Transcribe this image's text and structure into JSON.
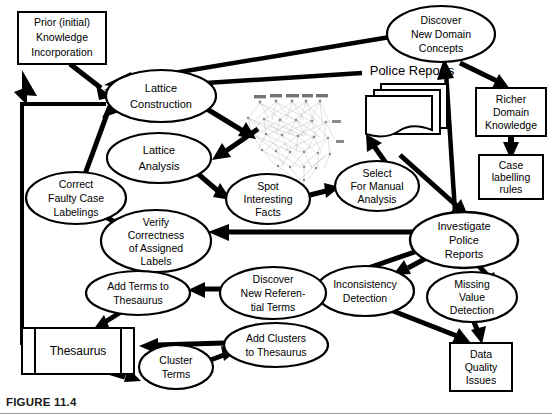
{
  "figure": {
    "caption": "FIGURE 11.4",
    "width": 552,
    "height": 415,
    "background_color": "#ffffff",
    "line_color": "#000000",
    "text_color": "#000000"
  },
  "diagram": {
    "type": "flow-diagram",
    "nodes": [
      {
        "id": "prior-knowledge",
        "shape": "rectangle",
        "label": "Prior (initial)\nKnowledge\nIncorporation",
        "lines": [
          "Prior (initial)",
          "Knowledge",
          "Incorporation"
        ],
        "cx": 62,
        "cy": 38,
        "w": 88,
        "h": 52
      },
      {
        "id": "lattice-construction",
        "shape": "ellipse",
        "label": "Lattice\nConstruction",
        "lines": [
          "Lattice",
          "Construction"
        ],
        "cx": 161,
        "cy": 96,
        "rx": 55,
        "ry": 26
      },
      {
        "id": "lattice-analysis",
        "shape": "ellipse",
        "label": "Lattice\nAnalysis",
        "lines": [
          "Lattice",
          "Analysis"
        ],
        "cx": 159,
        "cy": 158,
        "rx": 52,
        "ry": 25
      },
      {
        "id": "correct-faulty-case-labelings",
        "shape": "ellipse",
        "label": "Correct\nFaulty Case\nLabelings",
        "lines": [
          "Correct",
          "Faulty Case",
          "Labelings"
        ],
        "cx": 76,
        "cy": 198,
        "rx": 50,
        "ry": 26
      },
      {
        "id": "verify-correctness",
        "shape": "ellipse",
        "label": "Verify\nCorrectness\nof Assigned\nLabels",
        "lines": [
          "Verify",
          "Correctness",
          "of Assigned",
          "Labels"
        ],
        "cx": 156,
        "cy": 241,
        "rx": 55,
        "ry": 31
      },
      {
        "id": "spot-interesting-facts",
        "shape": "ellipse",
        "label": "Spot\nInteresting\nFacts",
        "lines": [
          "Spot",
          "Interesting",
          "Facts"
        ],
        "cx": 268,
        "cy": 199,
        "rx": 42,
        "ry": 25
      },
      {
        "id": "select-for-manual-analysis",
        "shape": "ellipse",
        "label": "Select\nFor Manual\nAnalysis",
        "lines": [
          "Select",
          "For Manual",
          "Analysis"
        ],
        "cx": 377,
        "cy": 186,
        "rx": 42,
        "ry": 25
      },
      {
        "id": "discover-new-domain-concepts",
        "shape": "ellipse",
        "label": "Discover\nNew Domain\nConcepts",
        "lines": [
          "Discover",
          "New Domain",
          "Concepts"
        ],
        "cx": 441,
        "cy": 34,
        "rx": 54,
        "ry": 28
      },
      {
        "id": "police-reports-label",
        "shape": "text",
        "label": "Police Reports",
        "lines": [
          "Police Reports"
        ],
        "cx": 412,
        "cy": 72
      },
      {
        "id": "police-reports-docs",
        "shape": "document-stack",
        "label": "",
        "lines": [],
        "cx": 400,
        "cy": 110
      },
      {
        "id": "richer-domain-knowledge",
        "shape": "rectangle",
        "label": "Richer\nDomain\nKnowledge",
        "lines": [
          "Richer",
          "Domain",
          "Knowledge"
        ],
        "cx": 511,
        "cy": 112,
        "w": 70,
        "h": 48
      },
      {
        "id": "case-labelling-rules",
        "shape": "rectangle",
        "label": "Case\nlabelling\nrules",
        "lines": [
          "Case",
          "labelling",
          "rules"
        ],
        "cx": 511,
        "cy": 177,
        "w": 64,
        "h": 44
      },
      {
        "id": "investigate-police-reports",
        "shape": "ellipse",
        "label": "Investigate\nPolice\nReports",
        "lines": [
          "Investigate",
          "Police",
          "Reports"
        ],
        "cx": 464,
        "cy": 240,
        "rx": 54,
        "ry": 28
      },
      {
        "id": "inconsistency-detection",
        "shape": "ellipse",
        "label": "Inconsistency\nDetection",
        "lines": [
          "Inconsistency",
          "Detection"
        ],
        "cx": 365,
        "cy": 291,
        "rx": 49,
        "ry": 25
      },
      {
        "id": "missing-value-detection",
        "shape": "ellipse",
        "label": "Missing\nValue\nDetection",
        "lines": [
          "Missing",
          "Value",
          "Detection"
        ],
        "cx": 472,
        "cy": 297,
        "rx": 45,
        "ry": 25
      },
      {
        "id": "data-quality-issues",
        "shape": "rectangle",
        "label": "Data\nQuality\nIssues",
        "lines": [
          "Data",
          "Quality",
          "Issues"
        ],
        "cx": 481,
        "cy": 367,
        "w": 62,
        "h": 48
      },
      {
        "id": "discover-new-referential-terms",
        "shape": "ellipse",
        "label": "Discover\nNew Referen-\ntial Terms",
        "lines": [
          "Discover",
          "New Referen-",
          "tial Terms"
        ],
        "cx": 273,
        "cy": 293,
        "rx": 53,
        "ry": 26
      },
      {
        "id": "add-terms-to-thesaurus",
        "shape": "ellipse",
        "label": "Add Terms to\nThesaurus",
        "lines": [
          "Add Terms to",
          "Thesaurus"
        ],
        "cx": 138,
        "cy": 293,
        "rx": 52,
        "ry": 22
      },
      {
        "id": "add-clusters-to-thesaurus",
        "shape": "ellipse",
        "label": "Add Clusters\nto Thesaurus",
        "lines": [
          "Add Clusters",
          "to Thesaurus"
        ],
        "cx": 276,
        "cy": 345,
        "rx": 52,
        "ry": 22
      },
      {
        "id": "thesaurus",
        "shape": "data-store",
        "label": "Thesaurus",
        "lines": [
          "Thesaurus"
        ],
        "cx": 78,
        "cy": 351,
        "w": 112,
        "h": 46
      },
      {
        "id": "cluster-terms",
        "shape": "ellipse",
        "label": "Cluster\nTerms",
        "lines": [
          "Cluster",
          "Terms"
        ],
        "cx": 176,
        "cy": 367,
        "rx": 37,
        "ry": 22
      },
      {
        "id": "lattice-graphic",
        "shape": "lattice-image",
        "label": "",
        "lines": [],
        "cx": 285,
        "cy": 128
      }
    ],
    "edges": [
      {
        "from": "prior-knowledge",
        "to": "lattice-construction"
      },
      {
        "from": "discover-new-domain-concepts",
        "to": "lattice-construction"
      },
      {
        "from": "police-reports-label",
        "to": "lattice-construction"
      },
      {
        "from": "thesaurus",
        "to": "lattice-construction"
      },
      {
        "from": "correct-faulty-case-labelings",
        "to": "lattice-construction"
      },
      {
        "from": "lattice-construction",
        "to": "lattice-graphic"
      },
      {
        "from": "lattice-graphic",
        "to": "lattice-analysis"
      },
      {
        "from": "lattice-analysis",
        "to": "spot-interesting-facts"
      },
      {
        "from": "spot-interesting-facts",
        "to": "select-for-manual-analysis"
      },
      {
        "from": "select-for-manual-analysis",
        "to": "police-reports-docs"
      },
      {
        "from": "investigate-police-reports",
        "to": "discover-new-domain-concepts"
      },
      {
        "from": "discover-new-domain-concepts",
        "to": "richer-domain-knowledge"
      },
      {
        "from": "richer-domain-knowledge",
        "to": "case-labelling-rules"
      },
      {
        "from": "select-for-manual-analysis",
        "to": "investigate-police-reports"
      },
      {
        "from": "investigate-police-reports",
        "to": "verify-correctness"
      },
      {
        "from": "verify-correctness",
        "to": "correct-faulty-case-labelings"
      },
      {
        "from": "investigate-police-reports",
        "to": "discover-new-referential-terms"
      },
      {
        "from": "discover-new-referential-terms",
        "to": "add-terms-to-thesaurus"
      },
      {
        "from": "add-terms-to-thesaurus",
        "to": "thesaurus"
      },
      {
        "from": "investigate-police-reports",
        "to": "inconsistency-detection"
      },
      {
        "from": "investigate-police-reports",
        "to": "missing-value-detection"
      },
      {
        "from": "inconsistency-detection",
        "to": "data-quality-issues"
      },
      {
        "from": "missing-value-detection",
        "to": "data-quality-issues"
      },
      {
        "from": "add-clusters-to-thesaurus",
        "to": "thesaurus"
      },
      {
        "from": "thesaurus",
        "to": "cluster-terms"
      },
      {
        "from": "cluster-terms",
        "to": "add-clusters-to-thesaurus"
      }
    ]
  }
}
